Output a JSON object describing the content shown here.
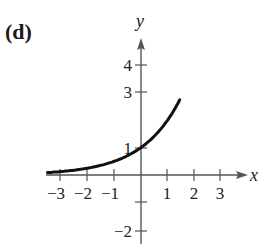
{
  "panel": {
    "label": "(d)"
  },
  "chart_data": {
    "type": "line",
    "title": "",
    "xlabel": "x",
    "ylabel": "y",
    "function": "y = 2^x",
    "x": [
      -3.5,
      -3,
      -2,
      -1,
      0,
      1,
      1.45
    ],
    "y": [
      0.088,
      0.125,
      0.25,
      0.5,
      1,
      2,
      2.73
    ],
    "xlim": [
      -3.5,
      4
    ],
    "ylim": [
      -2.5,
      5
    ],
    "x_ticks": [
      -3,
      -2,
      -1,
      1,
      2,
      3
    ],
    "y_ticks": [
      -2,
      -1,
      1,
      3,
      4
    ],
    "x_tick_labels": [
      "−3",
      "−2",
      "−1",
      "1",
      "2",
      "3"
    ],
    "y_tick_labels": [
      "−2",
      "1",
      "3",
      "4"
    ],
    "grid": false,
    "legend": null,
    "annotations": []
  },
  "axes": {
    "x_label": "x",
    "y_label": "y",
    "x_ticks": [
      {
        "label": "−3",
        "px": 60
      },
      {
        "label": "−2",
        "px": 87
      },
      {
        "label": "−1",
        "px": 114
      },
      {
        "label": "1",
        "px": 167
      },
      {
        "label": "2",
        "px": 194
      },
      {
        "label": "3",
        "px": 220
      }
    ],
    "y_ticks": [
      {
        "label": "4",
        "py": 65
      },
      {
        "label": "3",
        "py": 92
      },
      {
        "label": "1",
        "py": 148
      },
      {
        "label": "",
        "py": 202
      },
      {
        "label": "−2",
        "py": 231
      }
    ]
  },
  "colors": {
    "curve": "#111111",
    "axis": "#555555",
    "text": "#222222"
  }
}
